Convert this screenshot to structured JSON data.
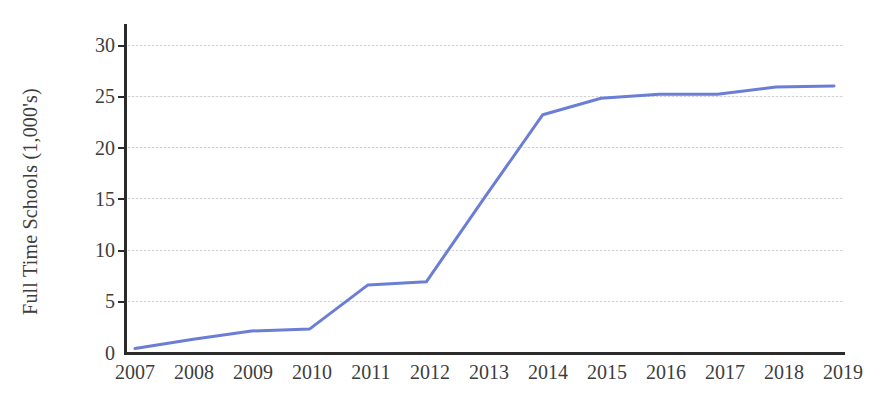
{
  "chart_data": {
    "type": "line",
    "title": "",
    "subtitle": "",
    "xlabel": "",
    "ylabel": "Full Time Schools (1,000's)",
    "x": [
      2007,
      2008,
      2009,
      2010,
      2011,
      2012,
      2013,
      2014,
      2015,
      2016,
      2017,
      2018,
      2019
    ],
    "categories": [
      "2007",
      "2008",
      "2009",
      "2010",
      "2011",
      "2012",
      "2013",
      "2014",
      "2015",
      "2016",
      "2017",
      "2018",
      "2019"
    ],
    "values": [
      0.4,
      1.3,
      2.1,
      2.3,
      6.6,
      6.9,
      15.1,
      23.2,
      24.8,
      25.2,
      25.2,
      25.9,
      26.0
    ],
    "series": [
      {
        "name": "Full Time Schools",
        "color": "#6b7ed6",
        "values": [
          0.4,
          1.3,
          2.1,
          2.3,
          6.6,
          6.9,
          15.1,
          23.2,
          24.8,
          25.2,
          25.2,
          25.9,
          26.0
        ]
      }
    ],
    "xlim": [
      2007,
      2019
    ],
    "ylim": [
      0,
      30
    ],
    "yticks": [
      0,
      5,
      10,
      15,
      20,
      25,
      30
    ],
    "ytick_labels": [
      "0",
      "5",
      "10",
      "15",
      "20",
      "25",
      "30"
    ],
    "xtick_labels": [
      "2007",
      "2008",
      "2009",
      "2010",
      "2011",
      "2012",
      "2013",
      "2014",
      "2015",
      "2016",
      "2017",
      "2018",
      "2019"
    ],
    "grid": true,
    "grid_axis": "y",
    "grid_style": "dotted",
    "grid_color": "#c9c9c9",
    "legend": false,
    "legend_position": "none",
    "line_color": "#6b7ed6",
    "line_width": 3,
    "markers": false,
    "background_color": "#ffffff",
    "axis_color": "#2b2b2b",
    "text_color": "#3d3d3d",
    "annotations": []
  }
}
